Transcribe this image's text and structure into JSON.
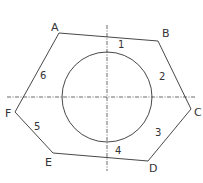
{
  "diagram": {
    "colors": {
      "stroke": "#333333",
      "background": "#ffffff"
    },
    "vertices": [
      {
        "label": "A",
        "x": 59,
        "y": 33,
        "lx": 51,
        "ly": 31
      },
      {
        "label": "B",
        "x": 158,
        "y": 41,
        "lx": 162,
        "ly": 37
      },
      {
        "label": "C",
        "x": 191,
        "y": 109,
        "lx": 194,
        "ly": 116
      },
      {
        "label": "D",
        "x": 148,
        "y": 161,
        "lx": 149,
        "ly": 172
      },
      {
        "label": "E",
        "x": 53,
        "y": 153,
        "lx": 45,
        "ly": 166
      },
      {
        "label": "F",
        "x": 15,
        "y": 112,
        "lx": 5,
        "ly": 117
      }
    ],
    "sides": [
      {
        "label": "1",
        "x": 118,
        "y": 48
      },
      {
        "label": "2",
        "x": 159,
        "y": 80
      },
      {
        "label": "3",
        "x": 155,
        "y": 136
      },
      {
        "label": "4",
        "x": 115,
        "y": 154
      },
      {
        "label": "5",
        "x": 34,
        "y": 130
      },
      {
        "label": "6",
        "x": 40,
        "y": 79
      }
    ],
    "circle": {
      "cx": 107,
      "cy": 97,
      "r": 45
    },
    "centerlines": {
      "horizontal": {
        "x1": 7,
        "y1": 97,
        "x2": 196,
        "y2": 97
      },
      "vertical": {
        "x1": 107,
        "y1": 25,
        "x2": 107,
        "y2": 171
      }
    }
  }
}
